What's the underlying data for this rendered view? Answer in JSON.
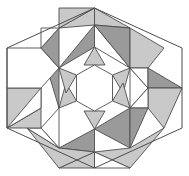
{
  "figure": {
    "shape": "hexagon",
    "width": 189,
    "height": 176
  },
  "palette": {
    "white": "#ffffff",
    "light_gray": "#c9c9c9",
    "dark_gray": "#9a9a9a",
    "stroke": "#4d4d4d",
    "background": "#ffffff"
  },
  "geometry": {
    "hexagon_outline": "94.5,8 182,48 182,128 94.5,168 7,128 7,48",
    "center": [
      94.5,
      88
    ],
    "star_outer_radius": 41,
    "star_inner_radius": 21
  },
  "chart_data": {
    "type": "diagram",
    "shape_counts": {
      "triangles": 30,
      "kites": 6,
      "trapezoids": 6,
      "central_hexagon": 1
    },
    "shading_levels": [
      "white",
      "light_gray",
      "dark_gray"
    ]
  },
  "tiles": [
    {
      "name": "star-point-top",
      "points": "94.5,47 84,65 105,65",
      "fill": "#c9c9c9"
    },
    {
      "name": "star-point-upper-right",
      "points": "130,68 112.5,75 123,93",
      "fill": "#c9c9c9"
    },
    {
      "name": "star-point-lower-right",
      "points": "130,108 123,83 112.5,101",
      "fill": "#c9c9c9"
    },
    {
      "name": "star-point-bottom",
      "points": "94.5,129 105,111 84,111",
      "fill": "#c9c9c9"
    },
    {
      "name": "star-point-lower-left",
      "points": "59,108 76.5,101 66,83",
      "fill": "#c9c9c9"
    },
    {
      "name": "star-point-upper-left",
      "points": "59,68 66,93 76.5,75",
      "fill": "#c9c9c9"
    },
    {
      "name": "star-core-hexagon",
      "points": "94.5,65 112.5,75 112.5,101 94.5,111 76.5,101 76.5,75",
      "fill": "#ffffff"
    },
    {
      "name": "ring-triangle-top-left-dark",
      "points": "59,68 94.5,47 94.5,25",
      "fill": "#9a9a9a"
    },
    {
      "name": "ring-triangle-top-right-white",
      "points": "94.5,25 94.5,47 130,68",
      "fill": "#ffffff"
    },
    {
      "name": "ring-triangle-right-upper-white",
      "points": "130,68 130,108 148,88",
      "fill": "#ffffff"
    },
    {
      "name": "ring-triangle-right-lower-dark",
      "points": "130,108 94.5,129 130,148",
      "fill": "#9a9a9a"
    },
    {
      "name": "ring-triangle-bottom-dark",
      "points": "94.5,129 94.5,152 59,148",
      "fill": "#9a9a9a"
    },
    {
      "name": "ring-triangle-left-lower-white",
      "points": "59,108 59,148 41,128",
      "fill": "#ffffff"
    },
    {
      "name": "ring-triangle-left-upper-dark",
      "points": "59,68 41,48 59,108",
      "fill": "#9a9a9a"
    },
    {
      "name": "outer-triangle-top-left-light",
      "points": "59,28 94.5,8 94.5,25",
      "fill": "#c9c9c9"
    },
    {
      "name": "outer-triangle-top-right-light",
      "points": "94.5,8 130,28 94.5,25",
      "fill": "#c9c9c9"
    },
    {
      "name": "outer-triangle-top-right-dark",
      "points": "130,28 130,68 94.5,25",
      "fill": "#9a9a9a"
    },
    {
      "name": "outer-kite-upper-right",
      "points": "130,28 164,48 148,68 130,68",
      "fill": "#c9c9c9"
    },
    {
      "name": "outer-triangle-upper-right-white",
      "points": "130,68 148,68 148,88",
      "fill": "#ffffff"
    },
    {
      "name": "outer-triangle-right-dark",
      "points": "148,68 182,88 148,88",
      "fill": "#9a9a9a"
    },
    {
      "name": "outer-kite-lower-right",
      "points": "148,88 182,88 164,128 148,108",
      "fill": "#c9c9c9"
    },
    {
      "name": "outer-triangle-lower-right-white",
      "points": "130,108 148,88 148,108",
      "fill": "#ffffff"
    },
    {
      "name": "outer-triangle-lower-right-dark2",
      "points": "130,108 148,108 130,148",
      "fill": "#9a9a9a"
    },
    {
      "name": "outer-kite-bottom-right",
      "points": "130,148 164,128 130,168 94.5,152",
      "fill": "#c9c9c9"
    },
    {
      "name": "outer-triangle-bottom-white",
      "points": "94.5,152 130,168 94.5,168",
      "fill": "#ffffff"
    },
    {
      "name": "outer-triangle-bottom-left-light",
      "points": "59,168 94.5,152 94.5,168",
      "fill": "#c9c9c9"
    },
    {
      "name": "outer-kite-bottom-left",
      "points": "59,148 94.5,152 59,168 27,128",
      "fill": "#c9c9c9"
    },
    {
      "name": "outer-triangle-left-lower-white2",
      "points": "41,128 59,148 27,128",
      "fill": "#ffffff"
    },
    {
      "name": "outer-kite-left-lower",
      "points": "7,128 41,108 41,128 27,128",
      "fill": "#c9c9c9"
    },
    {
      "name": "outer-triangle-left-mid-light",
      "points": "7,88 41,88 41,108 7,128",
      "fill": "#c9c9c9"
    },
    {
      "name": "outer-triangle-left-white3",
      "points": "41,88 41,108 7,128",
      "fill": "#ffffff"
    },
    {
      "name": "band-white-diagonal-upper",
      "points": "41,48 59,68 41,88 7,88 7,48",
      "fill": "#ffffff"
    },
    {
      "name": "outer-triangle-upper-left-dark",
      "points": "41,48 59,28 59,68",
      "fill": "#9a9a9a"
    },
    {
      "name": "outer-triangle-upper-left-white2",
      "points": "41,48 59,28 41,28",
      "fill": "#ffffff"
    },
    {
      "name": "outer-kite-upper-left-light",
      "points": "59,28 94.5,8 59,8",
      "fill": "#c9c9c9"
    }
  ]
}
